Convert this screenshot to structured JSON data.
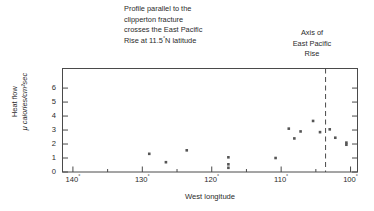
{
  "chart_data": {
    "type": "scatter",
    "title": "",
    "annotations": [
      {
        "name": "profile-note",
        "lines": [
          "Profile parallel to the",
          "clipperton fracture",
          "crosses the East Pacific",
          "Rise at 11.5°N latitude"
        ],
        "text": "Profile parallel to the clipperton fracture crosses the East Pacific Rise at 11.5°N latitude"
      },
      {
        "name": "ridge-axis-note",
        "lines": [
          "Axis of",
          "East Pacific",
          "Rise"
        ],
        "text": "Axis of East Pacific Rise"
      }
    ],
    "xlabel": "West longitude",
    "ylabel_line1": "Heat flow",
    "ylabel_line2": "μ calories/cm²sec",
    "xlim": [
      141.5,
      99.0
    ],
    "ylim": [
      0,
      7.4
    ],
    "x_inverted": true,
    "grid": false,
    "legend": null,
    "xticks": [
      140,
      130,
      120,
      110,
      100
    ],
    "xtick_labels": [
      "140°",
      "130°",
      "120°",
      "110°",
      "100°"
    ],
    "xminor_ticks": [
      135,
      125,
      115,
      105
    ],
    "yticks": [
      0,
      1,
      2,
      3,
      4,
      5,
      6
    ],
    "ytick_labels": [
      "0",
      "1",
      "2",
      "3",
      "4",
      "5",
      "6"
    ],
    "x": [
      129.0,
      126.6,
      123.6,
      117.6,
      117.6,
      117.6,
      110.8,
      108.9,
      108.1,
      107.2,
      105.4,
      104.4,
      103.0,
      102.2,
      100.6,
      100.6
    ],
    "y": [
      1.3,
      0.7,
      1.55,
      1.05,
      0.55,
      0.3,
      1.0,
      3.1,
      2.4,
      2.9,
      3.65,
      2.85,
      3.05,
      2.45,
      2.1,
      1.95
    ],
    "marker": "square",
    "marker_color": "#555555",
    "vline": {
      "name": "east-pacific-rise-axis",
      "x": 103.6,
      "style": "dashed",
      "label": "Axis of East Pacific Rise"
    }
  }
}
